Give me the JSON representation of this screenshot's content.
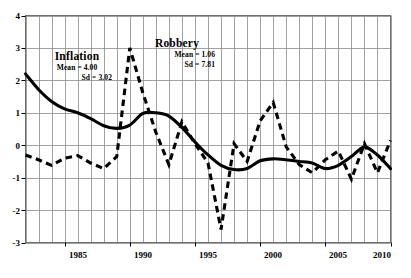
{
  "chart_data": {
    "type": "line",
    "title": "",
    "xlabel": "",
    "ylabel": "",
    "xlim": [
      1982,
      2010
    ],
    "ylim": [
      -3,
      4
    ],
    "grid": true,
    "legend": "none",
    "x_ticks": [
      "1985",
      "1990",
      "1995",
      "2000",
      "2005",
      "2010"
    ],
    "x_tick_values": [
      1985,
      1990,
      1995,
      2000,
      2005,
      2010
    ],
    "y_ticks": [
      "4",
      "3",
      "2",
      "1",
      "0",
      "-1",
      "-2",
      "-3"
    ],
    "y_tick_values": [
      4,
      3,
      2,
      1,
      0,
      -1,
      -2,
      -3
    ],
    "x": [
      1982,
      1983,
      1984,
      1985,
      1986,
      1987,
      1988,
      1989,
      1990,
      1991,
      1992,
      1993,
      1994,
      1995,
      1996,
      1997,
      1998,
      1999,
      2000,
      2001,
      2002,
      2003,
      2004,
      2005,
      2006,
      2007,
      2008,
      2009,
      2010
    ],
    "series": [
      {
        "name": "Inflation",
        "style": "solid",
        "color": "#000000",
        "mean_label": "Mean = 4.00",
        "sd_label": "Sd = 3.02",
        "mean": 4.0,
        "sd": 3.02,
        "values": [
          2.2,
          1.72,
          1.35,
          1.12,
          1.0,
          0.82,
          0.6,
          0.52,
          0.62,
          0.98,
          1.0,
          0.9,
          0.55,
          0.1,
          -0.3,
          -0.62,
          -0.75,
          -0.72,
          -0.48,
          -0.42,
          -0.45,
          -0.5,
          -0.55,
          -0.72,
          -0.62,
          -0.35,
          -0.05,
          -0.3,
          -0.72
        ]
      },
      {
        "name": "Robbery",
        "style": "dashed",
        "color": "#000000",
        "mean_label": "Mean = 1.06",
        "sd_label": "Sd = 7.81",
        "mean": 1.06,
        "sd": 7.81,
        "values": [
          -0.3,
          -0.45,
          -0.62,
          -0.4,
          -0.32,
          -0.55,
          -0.72,
          -0.35,
          3.0,
          1.62,
          0.4,
          -0.6,
          0.72,
          0.05,
          -0.55,
          -2.6,
          0.05,
          -0.5,
          0.75,
          1.32,
          -0.05,
          -0.6,
          -0.85,
          -0.45,
          -0.18,
          -1.05,
          0.05,
          -0.85,
          0.15
        ]
      }
    ],
    "annotations": [
      {
        "name": "inflation-label",
        "text": "Inflation",
        "x": 1986,
        "y": 2.1
      },
      {
        "name": "robbery-label",
        "text": "Robbery",
        "x": 1992,
        "y": 2.65
      }
    ]
  },
  "axis": {
    "y_label_4": "4",
    "y_label_3": "3",
    "y_label_2": "2",
    "y_label_1": "1",
    "y_label_0": "0",
    "y_label_m1": "-1",
    "y_label_m2": "-2",
    "y_label_m3": "-3",
    "x_label_1985": "1985",
    "x_label_1990": "1990",
    "x_label_1995": "1995",
    "x_label_2000": "2000",
    "x_label_2005": "2005",
    "x_label_2010": "2010"
  },
  "annotations": {
    "inflation": {
      "title": "Inflation",
      "mean": "Mean = 4.00",
      "sd": "Sd = 3.02"
    },
    "robbery": {
      "title": "Robbery",
      "mean": "Mean = 1.06",
      "sd": "Sd = 7.81"
    }
  }
}
